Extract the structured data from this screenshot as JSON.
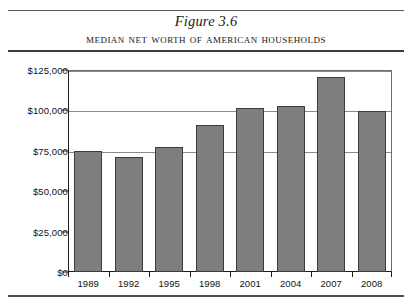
{
  "figure": {
    "label": "Figure 3.6",
    "title": "Median Net Worth of American Households"
  },
  "chart_data": {
    "type": "bar",
    "title": "Median Net Worth of American Households",
    "subtitle": "Figure 3.6",
    "xlabel": "",
    "ylabel": "",
    "categories": [
      "1989",
      "1992",
      "1995",
      "1998",
      "2001",
      "2004",
      "2007",
      "2008"
    ],
    "values": [
      75000,
      71000,
      77500,
      91000,
      101500,
      102500,
      120500,
      99500
    ],
    "ylim": [
      0,
      125000
    ],
    "ytick_values": [
      0,
      25000,
      50000,
      75000,
      100000,
      125000
    ],
    "ytick_labels": [
      "$0",
      "$25,000",
      "$50,000",
      "$75,000",
      "$100,000",
      "$125,000"
    ],
    "gridlines": [
      "$75,000",
      "$100,000",
      "$125,000"
    ],
    "grid": true,
    "legend": "none",
    "bar_color": "#7e7e7e",
    "bar_border_color": "#3c3c3c",
    "axis_color": "#1d1d1d",
    "gridline_color": "#8a8a8a",
    "background": "#ffffff"
  }
}
